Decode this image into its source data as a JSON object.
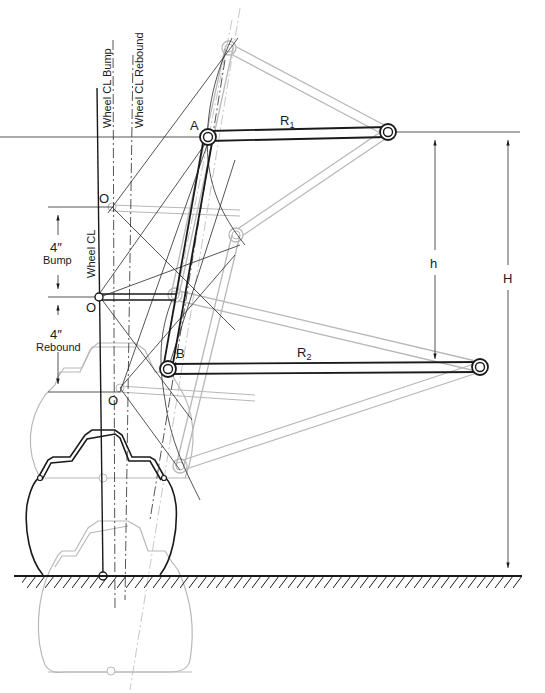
{
  "diagram": {
    "labels": {
      "wheel_cl_bump": "Wheel CL Bump",
      "wheel_cl_rebound": "Wheel CL Rebound",
      "wheel_cl": "Wheel CL",
      "point_a": "A",
      "point_b": "B",
      "r1": "R",
      "r1_sub": "1",
      "r2": "R",
      "r2_sub": "2",
      "h": "h",
      "H": "H",
      "o_top": "O",
      "o_mid": "O",
      "o_bottom": "O",
      "bump_value": "4″",
      "bump_label": "Bump",
      "rebound_value": "4″",
      "rebound_label": "Rebound"
    },
    "dimensions": {
      "bump_travel": "4″",
      "rebound_travel": "4″"
    },
    "colors": {
      "ink": "#1a1a1a",
      "ghost": "#b8b8b8",
      "background": "#ffffff"
    },
    "legend": {
      "solid_dark": "Design (static) position",
      "light_gray": "Bump and rebound positions"
    }
  }
}
